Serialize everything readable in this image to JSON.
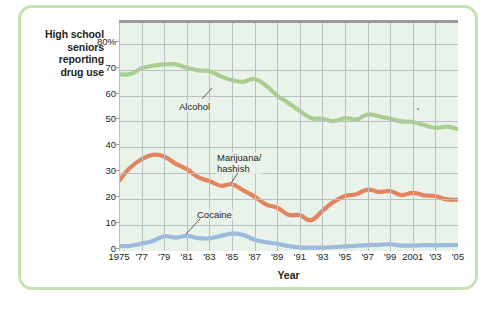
{
  "figure": {
    "y_axis_caption": [
      "High school",
      "seniors",
      "reporting",
      "drug use"
    ],
    "x_axis_title": "Year",
    "frame_color": "#c5e0b4",
    "plot_background": "#eaf3ea"
  },
  "chart_data": {
    "type": "line",
    "title": "",
    "xlabel": "Year",
    "ylabel": "High school seniors reporting drug use",
    "ylim": [
      0,
      88
    ],
    "xlim": [
      1975,
      2005
    ],
    "grid": true,
    "legend": "annotations-on-plot",
    "ytick_labels": [
      "80%",
      "70",
      "60",
      "50",
      "40",
      "30",
      "20",
      "10",
      "0"
    ],
    "ytick_values": [
      80,
      70,
      60,
      50,
      40,
      30,
      20,
      10,
      0
    ],
    "xtick_labels": [
      "1975",
      "'77",
      "'79",
      "'81",
      "'83",
      "'85",
      "'87",
      "'89",
      "'91",
      "'93",
      "'95",
      "'97",
      "'99",
      "2001",
      "'03",
      "'05"
    ],
    "xtick_values": [
      1975,
      1977,
      1979,
      1981,
      1983,
      1985,
      1987,
      1989,
      1991,
      1993,
      1995,
      1997,
      1999,
      2001,
      2003,
      2005
    ],
    "x": [
      1975,
      1976,
      1977,
      1978,
      1979,
      1980,
      1981,
      1982,
      1983,
      1984,
      1985,
      1986,
      1987,
      1988,
      1989,
      1990,
      1991,
      1992,
      1993,
      1994,
      1995,
      1996,
      1997,
      1998,
      1999,
      2000,
      2001,
      2002,
      2003,
      2004,
      2005
    ],
    "series": [
      {
        "name": "Alcohol",
        "color": "#a8cf8e",
        "label_text": "Alcohol",
        "values": [
          68.2,
          68.3,
          70.5,
          71.5,
          72.0,
          72.0,
          70.7,
          69.7,
          69.4,
          67.4,
          65.9,
          65.3,
          66.4,
          63.9,
          60.0,
          57.1,
          54.0,
          51.3,
          51.0,
          50.1,
          51.3,
          50.8,
          52.7,
          52.0,
          51.0,
          50.0,
          49.8,
          48.6,
          47.5,
          48.0,
          47.0
        ]
      },
      {
        "name": "Marijuana/hashish",
        "color": "#e2845e",
        "label_text": [
          "Marijuana/",
          "hashish"
        ],
        "values": [
          27.1,
          32.2,
          35.4,
          37.1,
          36.5,
          33.7,
          31.6,
          28.5,
          27.0,
          25.2,
          25.7,
          23.4,
          21.0,
          18.0,
          16.7,
          14.0,
          13.8,
          11.9,
          15.5,
          19.0,
          21.2,
          21.9,
          23.7,
          22.8,
          23.1,
          21.6,
          22.4,
          21.5,
          21.2,
          19.9,
          19.8
        ]
      },
      {
        "name": "Cocaine",
        "color": "#9bbbdd",
        "label_text": "Cocaine",
        "values": [
          1.9,
          2.0,
          2.9,
          3.9,
          5.7,
          5.2,
          5.8,
          5.0,
          4.9,
          5.8,
          6.7,
          6.2,
          4.3,
          3.4,
          2.8,
          1.9,
          1.4,
          1.3,
          1.3,
          1.5,
          1.8,
          2.0,
          2.3,
          2.4,
          2.6,
          2.1,
          2.1,
          2.3,
          2.2,
          2.3,
          2.3
        ]
      }
    ],
    "annotations": [
      {
        "text": "Alcohol",
        "points_to_series": "Alcohol"
      },
      {
        "text": "Marijuana/ hashish",
        "points_to_series": "Marijuana/hashish"
      },
      {
        "text": "Cocaine",
        "points_to_series": "Cocaine"
      }
    ]
  }
}
